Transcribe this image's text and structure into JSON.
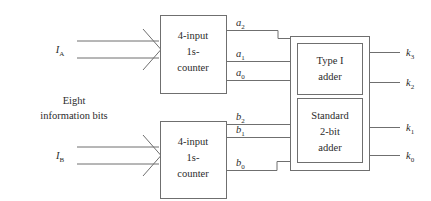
{
  "diagram": {
    "caption": {
      "line1": "Eight",
      "line2": "information bits"
    },
    "inputs": [
      {
        "name": "input-a",
        "base": "I",
        "sub": "A"
      },
      {
        "name": "input-b",
        "base": "I",
        "sub": "B"
      }
    ],
    "counters": [
      {
        "name": "counter-a",
        "line1": "4-input",
        "line2": "1s-",
        "line3": "counter"
      },
      {
        "name": "counter-b",
        "line1": "4-input",
        "line2": "1s-",
        "line3": "counter"
      }
    ],
    "adders": [
      {
        "name": "type-1-adder",
        "line1": "Type I",
        "line2": "adder",
        "line3": ""
      },
      {
        "name": "standard-2-bit-adder",
        "line1": "Standard",
        "line2": "2-bit",
        "line3": "adder"
      }
    ],
    "signals_a": [
      {
        "base": "a",
        "sub": "2"
      },
      {
        "base": "a",
        "sub": "1"
      },
      {
        "base": "a",
        "sub": "0"
      }
    ],
    "signals_b": [
      {
        "base": "b",
        "sub": "2"
      },
      {
        "base": "b",
        "sub": "1"
      },
      {
        "base": "b",
        "sub": "0"
      }
    ],
    "outputs": [
      {
        "base": "k",
        "sub": "3"
      },
      {
        "base": "k",
        "sub": "2"
      },
      {
        "base": "k",
        "sub": "1"
      },
      {
        "base": "k",
        "sub": "0"
      }
    ],
    "colors": {
      "stroke": "#6f6f6f",
      "text": "#2b2b2b",
      "background": "#ffffff"
    }
  }
}
